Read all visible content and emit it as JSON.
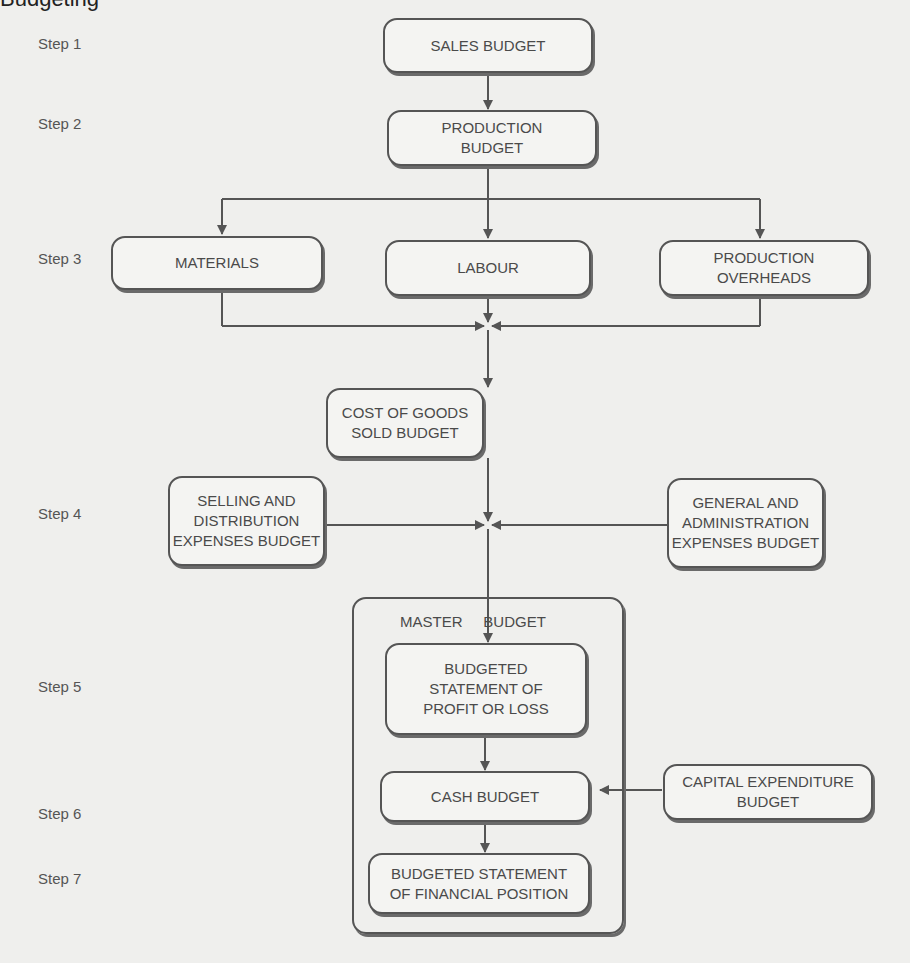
{
  "diagram": {
    "steps": [
      {
        "label": "Step 1"
      },
      {
        "label": "Step 2"
      },
      {
        "label": "Step 3"
      },
      {
        "label": "Step 4"
      },
      {
        "label": "Step 5"
      },
      {
        "label": "Step 6"
      },
      {
        "label": "Step 7"
      }
    ],
    "nodes": {
      "sales_budget": "SALES BUDGET",
      "production_budget": "PRODUCTION\nBUDGET",
      "materials": "MATERIALS",
      "labour": "LABOUR",
      "production_overheads": "PRODUCTION\nOVERHEADS",
      "cogs_budget": "COST OF GOODS\nSOLD BUDGET",
      "selling_distribution": "SELLING AND\nDISTRIBUTION\nEXPENSES BUDGET",
      "general_administration": "GENERAL AND\nADMINISTRATION\nEXPENSES BUDGET",
      "master_budget_title": "MASTER     BUDGET",
      "profit_or_loss": "BUDGETED\nSTATEMENT OF\nPROFIT OR LOSS",
      "cash_budget": "CASH BUDGET",
      "capital_expenditure": "CAPITAL EXPENDITURE\nBUDGET",
      "financial_position": "BUDGETED STATEMENT\nOF FINANCIAL POSITION"
    },
    "edges": [
      [
        "SALES BUDGET",
        "PRODUCTION BUDGET"
      ],
      [
        "PRODUCTION BUDGET",
        "MATERIALS"
      ],
      [
        "PRODUCTION BUDGET",
        "LABOUR"
      ],
      [
        "PRODUCTION BUDGET",
        "PRODUCTION OVERHEADS"
      ],
      [
        "MATERIALS",
        "COST OF GOODS SOLD BUDGET"
      ],
      [
        "LABOUR",
        "COST OF GOODS SOLD BUDGET"
      ],
      [
        "PRODUCTION OVERHEADS",
        "COST OF GOODS SOLD BUDGET"
      ],
      [
        "COST OF GOODS SOLD BUDGET",
        "BUDGETED STATEMENT OF PROFIT OR LOSS"
      ],
      [
        "SELLING AND DISTRIBUTION EXPENSES BUDGET",
        "BUDGETED STATEMENT OF PROFIT OR LOSS"
      ],
      [
        "GENERAL AND ADMINISTRATION EXPENSES BUDGET",
        "BUDGETED STATEMENT OF PROFIT OR LOSS"
      ],
      [
        "BUDGETED STATEMENT OF PROFIT OR LOSS",
        "CASH BUDGET"
      ],
      [
        "CAPITAL EXPENDITURE BUDGET",
        "CASH BUDGET"
      ],
      [
        "CASH BUDGET",
        "BUDGETED STATEMENT OF FINANCIAL POSITION"
      ]
    ],
    "colors": {
      "background": "#efefed",
      "line": "#555555",
      "text": "#4a4a4a"
    }
  }
}
